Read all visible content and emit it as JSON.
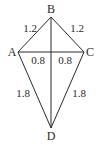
{
  "diagram": {
    "type": "kite",
    "vertices": {
      "A": {
        "label": "A",
        "x": 18,
        "y": 52
      },
      "B": {
        "label": "B",
        "x": 51,
        "y": 17
      },
      "C": {
        "label": "C",
        "x": 84,
        "y": 52
      },
      "D": {
        "label": "D",
        "x": 51,
        "y": 128
      }
    },
    "segment_labels": {
      "AB": "1.2",
      "BC": "1.2",
      "AO": "0.8",
      "OC": "0.8",
      "AD": "1.8",
      "CD": "1.8"
    },
    "colors": {
      "stroke": "#2a2a2a",
      "background": "#ffffff"
    }
  }
}
